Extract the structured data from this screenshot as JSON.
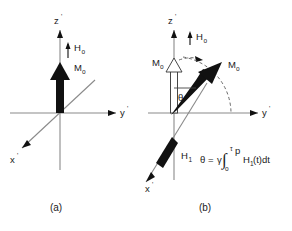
{
  "figure": {
    "panels": [
      {
        "id": "a",
        "caption": "(a)",
        "axes": [
          {
            "name": "z-prime",
            "label": "z",
            "prime": "'"
          },
          {
            "name": "y-prime",
            "label": "y",
            "prime": "'"
          },
          {
            "name": "x-prime",
            "label": "x",
            "prime": "'"
          }
        ],
        "vectors": [
          {
            "name": "H0",
            "label": "H",
            "subscript": "o",
            "style": "thin-arrow-up"
          },
          {
            "name": "M0",
            "label": "M",
            "subscript": "o",
            "style": "thick-arrow-up"
          }
        ]
      },
      {
        "id": "b",
        "caption": "(b)",
        "axes": [
          {
            "name": "z-prime",
            "label": "z",
            "prime": "'"
          },
          {
            "name": "y-prime",
            "label": "y",
            "prime": "'"
          },
          {
            "name": "x-prime",
            "label": "x",
            "prime": "'"
          }
        ],
        "vectors": [
          {
            "name": "H0",
            "label": "H",
            "subscript": "o",
            "style": "thin-arrow-up"
          },
          {
            "name": "M0-initial",
            "label": "M",
            "subscript": "o",
            "style": "hollow-arrow-up"
          },
          {
            "name": "M0-tipped",
            "label": "M",
            "subscript": "o",
            "style": "thick-arrow-tilted"
          },
          {
            "name": "H1",
            "label": "H",
            "subscript": "1",
            "style": "thick-arrow-along-x"
          }
        ],
        "angle": {
          "name": "theta",
          "label": "θ"
        },
        "equation": {
          "theta": "θ",
          "equals": "=",
          "gamma": "γ",
          "integral": "∫",
          "lower_limit": "o",
          "upper_limit_tau": "τ",
          "upper_limit_sub": "p",
          "integrand": "H",
          "integrand_sub": "1",
          "integrand_var": "(t)dt"
        }
      }
    ],
    "colors": {
      "background": "#ffffff",
      "axis": "#8a8a8a",
      "vector_solid": "#111111",
      "vector_hollow_fill": "#ffffff",
      "dashed": "#5a5a5a",
      "text": "#1a1a1a"
    }
  }
}
